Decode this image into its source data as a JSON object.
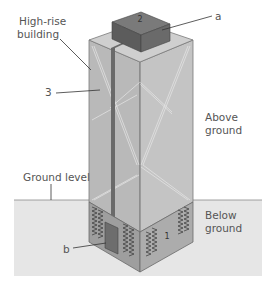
{
  "diagram": {
    "type": "labeled cross-section illustration",
    "labels": {
      "building": [
        "High-rise",
        "building"
      ],
      "above_ground": [
        "Above",
        "ground"
      ],
      "below_ground": [
        "Below",
        "ground"
      ],
      "ground_level": "Ground level",
      "part_a": "a",
      "part_b": "b",
      "num_1": "1",
      "num_2": "2",
      "num_3": "3"
    },
    "parts": [
      {
        "id": "1",
        "description": "below-ground foundation section with zigzag (spring) markings"
      },
      {
        "id": "2",
        "description": "dark box on roof"
      },
      {
        "id": "3",
        "description": "vertical shaft running down the building"
      },
      {
        "id": "a",
        "description": "pointer to roof box"
      },
      {
        "id": "b",
        "description": "pointer to dark block at base of shaft below ground"
      }
    ],
    "colors": {
      "ground": "#e6e6e6",
      "building_left": "#b9b9b9",
      "building_right": "#c4c4c4",
      "building_top": "#cfcfcf",
      "box_dark": "#6d6d6d",
      "shaft": "#6a6a6a",
      "below_left": "#9e9e9e",
      "below_right": "#acacac",
      "text": "#555555"
    }
  }
}
